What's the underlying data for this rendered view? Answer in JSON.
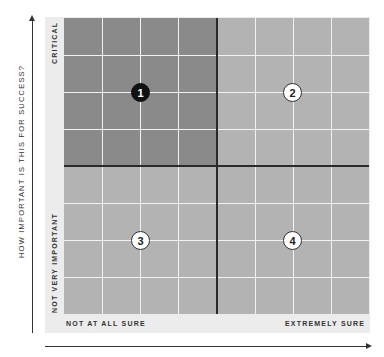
{
  "diagram": {
    "type": "2x2 quadrant matrix",
    "y_axis": {
      "title": "HOW IMPORTANT IS THIS FOR SUCCESS?",
      "top_label": "CRITICAL",
      "bottom_label": "NOT VERY IMPORTANT"
    },
    "x_axis": {
      "left_label": "NOT AT ALL SURE",
      "right_label": "EXTREMELY SURE"
    },
    "quadrants": [
      {
        "id": "1",
        "label": "1",
        "position": "top-left",
        "color": "#8a8a8a",
        "highlighted": true
      },
      {
        "id": "2",
        "label": "2",
        "position": "top-right",
        "color": "#b3b3b3",
        "highlighted": false
      },
      {
        "id": "3",
        "label": "3",
        "position": "bottom-left",
        "color": "#b3b3b3",
        "highlighted": false
      },
      {
        "id": "4",
        "label": "4",
        "position": "bottom-right",
        "color": "#b3b3b3",
        "highlighted": false
      }
    ],
    "grid": {
      "columns": 8,
      "rows": 8
    }
  }
}
